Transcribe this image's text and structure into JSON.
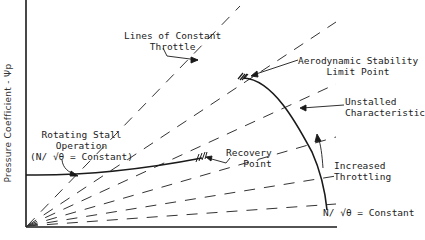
{
  "figure": {
    "y_axis_label": "Pressure Coefficient - Ψp",
    "labels": {
      "constant_throttle": [
        "Lines of Constant",
        "Throttle"
      ],
      "stability_limit": [
        "Aerodynamic Stability",
        "Limit Point"
      ],
      "unstalled": [
        "Unstalled",
        "Characteristic"
      ],
      "rotating_stall": [
        "Rotating Stall",
        "Operation",
        "(N/ √θ = Constant)"
      ],
      "recovery": [
        "Recovery",
        "Point"
      ],
      "increased_throttling": [
        "Increased",
        "Throttling"
      ],
      "speed_constant": "N/ √θ = Constant"
    },
    "colors": {
      "line": "#1a1a1a",
      "text": "#222222",
      "background": "#ffffff"
    }
  }
}
